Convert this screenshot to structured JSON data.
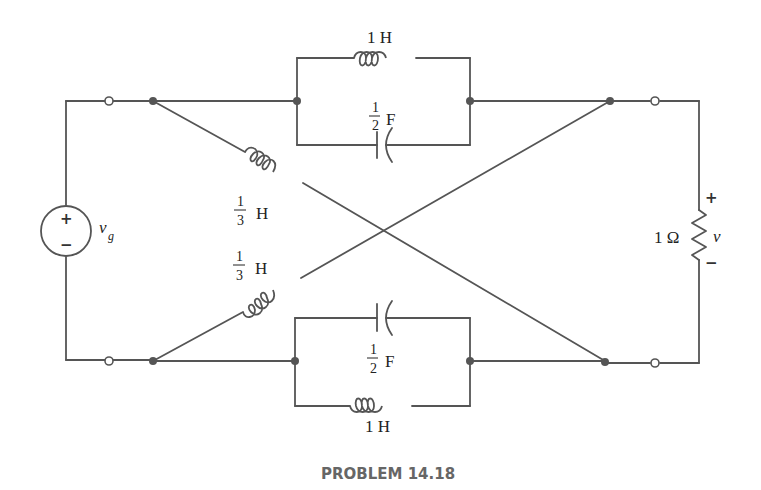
{
  "diagram": {
    "caption": "PROBLEM 14.18",
    "source": {
      "name": "v",
      "subscript": "g",
      "plus": "+",
      "minus": "−"
    },
    "top_branch": {
      "inductor_label": "1 H",
      "capacitor_num": "1",
      "capacitor_den": "2",
      "capacitor_unit": "F"
    },
    "bottom_branch": {
      "inductor_label": "1 H",
      "capacitor_num": "1",
      "capacitor_den": "2",
      "capacitor_unit": "F"
    },
    "cross_upper": {
      "num": "1",
      "den": "3",
      "unit": "H"
    },
    "cross_lower": {
      "num": "1",
      "den": "3",
      "unit": "H"
    },
    "load": {
      "resistance": "1 Ω",
      "voltage": "v",
      "plus": "+",
      "minus": "−"
    }
  }
}
